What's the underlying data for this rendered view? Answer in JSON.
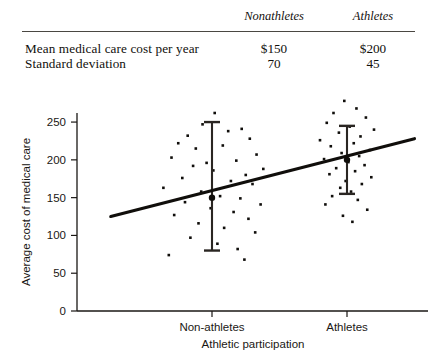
{
  "table": {
    "columns": [
      "Nonathletes",
      "Athletes"
    ],
    "rows": [
      {
        "label": "Mean medical care cost per year",
        "values": [
          "$150",
          "$200"
        ]
      },
      {
        "label": "Standard deviation",
        "values": [
          "70",
          "45"
        ]
      }
    ]
  },
  "chart_data": {
    "type": "scatter",
    "title": "",
    "xlabel": "Athletic participation",
    "ylabel": "Average cost of medical care",
    "categories": [
      "Non-athletes",
      "Athletes"
    ],
    "yticks": [
      0,
      50,
      100,
      150,
      200,
      250
    ],
    "ylim": [
      0,
      262
    ],
    "xlim": [
      0,
      2.6
    ],
    "grid": false,
    "legend": "none",
    "means": [
      150,
      200
    ],
    "std_devs": [
      70,
      45
    ],
    "error_bars": [
      {
        "category": "Non-athletes",
        "center": 150,
        "low": 80,
        "high": 250
      },
      {
        "category": "Athletes",
        "center": 200,
        "low": 155,
        "high": 245
      }
    ],
    "trend_line": {
      "x_start": 0.25,
      "x_end": 2.5,
      "y_start": 125,
      "y_end": 228
    },
    "series": [
      {
        "name": "Non-athletes",
        "x": [
          1.02,
          0.93,
          1.12,
          0.82,
          1.22,
          1.28,
          0.75,
          0.88,
          1.08,
          1.33,
          0.7,
          0.96,
          1.18,
          1.38,
          0.86,
          1.01,
          1.25,
          0.78,
          1.14,
          1.3,
          0.64,
          0.92,
          1.06,
          1.21,
          0.8,
          1.36,
          0.99,
          1.16,
          0.72,
          1.27,
          0.9,
          1.09,
          1.32,
          0.84,
          1.04,
          1.19,
          0.68,
          1.24
        ],
        "y": [
          262,
          247,
          238,
          232,
          241,
          228,
          222,
          215,
          219,
          207,
          203,
          196,
          199,
          188,
          192,
          186,
          180,
          176,
          172,
          168,
          163,
          158,
          152,
          149,
          144,
          141,
          136,
          131,
          127,
          122,
          116,
          110,
          104,
          97,
          89,
          82,
          74,
          68
        ]
      },
      {
        "name": "Athletes",
        "x": [
          1.98,
          2.07,
          1.9,
          2.14,
          1.85,
          2.02,
          2.2,
          1.94,
          2.1,
          1.8,
          2.05,
          1.88,
          2.17,
          1.96,
          2.09,
          1.83,
          2.01,
          2.13,
          1.92,
          2.06,
          1.87,
          2.18,
          1.99,
          2.11,
          1.95,
          2.03,
          1.89,
          2.08,
          1.84,
          2.15,
          1.97,
          2.04
        ],
        "y": [
          278,
          268,
          262,
          256,
          249,
          244,
          240,
          236,
          231,
          226,
          222,
          218,
          213,
          209,
          205,
          201,
          197,
          193,
          189,
          185,
          181,
          177,
          172,
          168,
          163,
          158,
          152,
          147,
          141,
          134,
          126,
          118
        ]
      }
    ]
  }
}
